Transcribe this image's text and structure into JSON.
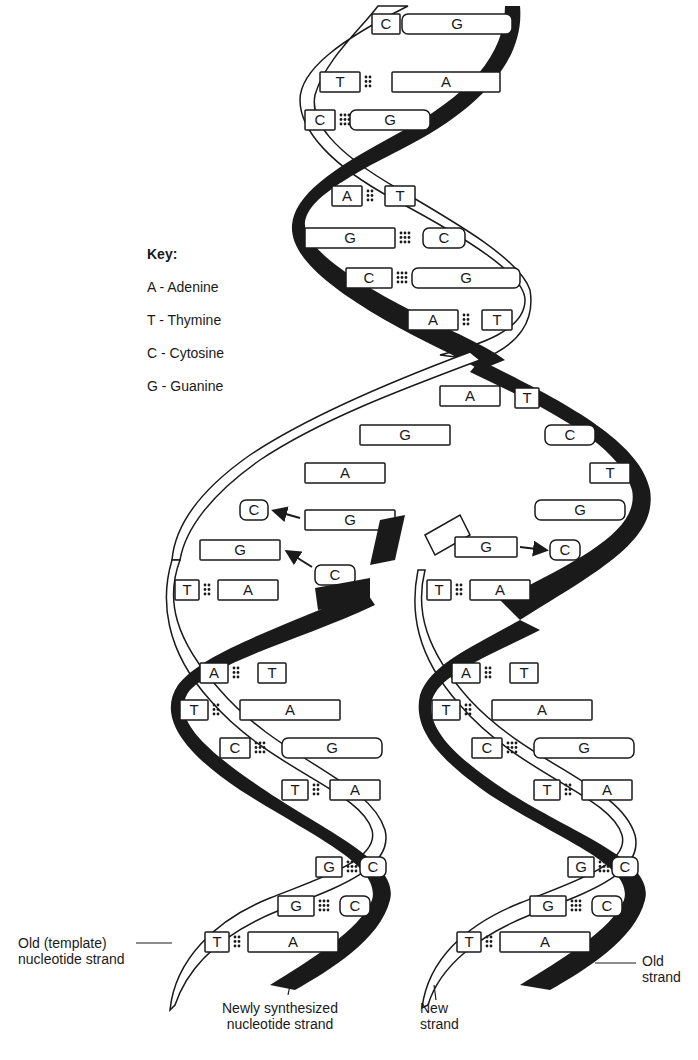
{
  "key": {
    "title": "Key:",
    "items": [
      {
        "letter": "A",
        "name": "Adenine",
        "text": "A - Adenine"
      },
      {
        "letter": "T",
        "name": "Thymine",
        "text": "T - Thymine"
      },
      {
        "letter": "C",
        "name": "Cytosine",
        "text": "C - Cytosine"
      },
      {
        "letter": "G",
        "name": "Guanine",
        "text": "G - Guanine"
      }
    ]
  },
  "labels": {
    "old_template_1": "Old (template)",
    "old_template_2": "nucleotide strand",
    "newly_1": "Newly synthesized",
    "newly_2": "nucleotide strand",
    "new_1": "New",
    "new_2": "strand",
    "old_1": "Old",
    "old_2": "strand"
  },
  "colors": {
    "ink": "#1a1a1a",
    "paper": "#ffffff"
  },
  "parent_helix_pairs": [
    {
      "left": "C",
      "right": "G",
      "bonds": 3
    },
    {
      "left": "T",
      "right": "A",
      "bonds": 2
    },
    {
      "left": "C",
      "right": "G",
      "bonds": 3
    },
    {
      "left": "A",
      "right": "T",
      "bonds": 2
    },
    {
      "left": "G",
      "right": "C",
      "bonds": 3
    },
    {
      "left": "C",
      "right": "G",
      "bonds": 3
    },
    {
      "left": "A",
      "right": "T",
      "bonds": 2
    }
  ],
  "unzipped_left_bases": [
    "A",
    "G",
    "A"
  ],
  "unzipped_right_bases": [
    "T",
    "C",
    "T",
    "G"
  ],
  "incoming_nucleotides": {
    "left": [
      {
        "free": "G",
        "target": "C"
      },
      {
        "free": "C",
        "target": "G"
      }
    ],
    "right": [
      {
        "free": "G",
        "target": "C"
      }
    ]
  },
  "daughter_left_pairs": [
    {
      "left": "T",
      "right": "A",
      "bonds": 2
    },
    {
      "left": "A",
      "right": "T",
      "bonds": 2
    },
    {
      "left": "T",
      "right": "A",
      "bonds": 2
    },
    {
      "left": "C",
      "right": "G",
      "bonds": 3
    },
    {
      "left": "T",
      "right": "A",
      "bonds": 2
    },
    {
      "left": "G",
      "right": "C",
      "bonds": 3
    },
    {
      "left": "G",
      "right": "C",
      "bonds": 3
    },
    {
      "left": "T",
      "right": "A",
      "bonds": 2
    }
  ],
  "daughter_right_pairs": [
    {
      "left": "T",
      "right": "A",
      "bonds": 2
    },
    {
      "left": "A",
      "right": "T",
      "bonds": 2
    },
    {
      "left": "T",
      "right": "A",
      "bonds": 2
    },
    {
      "left": "C",
      "right": "G",
      "bonds": 3
    },
    {
      "left": "T",
      "right": "A",
      "bonds": 2
    },
    {
      "left": "G",
      "right": "C",
      "bonds": 3
    },
    {
      "left": "G",
      "right": "C",
      "bonds": 3
    },
    {
      "left": "T",
      "right": "A",
      "bonds": 2
    }
  ]
}
